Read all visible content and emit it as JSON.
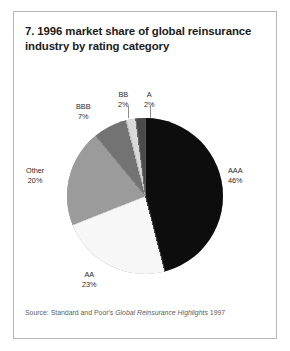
{
  "figure": {
    "title": "7. 1996 market share of global reinsurance industry by rating category",
    "source_prefix": "Source: Standard and Poor's ",
    "source_italic": "Global Reinsurance Highlights",
    "source_suffix": " 1997"
  },
  "chart_data": {
    "type": "pie",
    "title": "7. 1996 market share of global reinsurance industry by rating category",
    "unit": "percent",
    "categories": [
      "AAA",
      "AA",
      "Other",
      "BBB",
      "BB",
      "A"
    ],
    "values": [
      46,
      23,
      20,
      7,
      2,
      2
    ],
    "labels": [
      {
        "name": "AAA",
        "value": 46,
        "pct_text": "46%",
        "color": "#0d0d0d"
      },
      {
        "name": "AA",
        "value": 23,
        "pct_text": "23%",
        "color": "#f7f7f7"
      },
      {
        "name": "Other",
        "value": 20,
        "pct_text": "20%",
        "color": "#9b9b9b"
      },
      {
        "name": "BBB",
        "value": 7,
        "pct_text": "7%",
        "color": "#737373"
      },
      {
        "name": "BB",
        "value": 2,
        "pct_text": "2%",
        "color": "#d9d9d9"
      },
      {
        "name": "A",
        "value": 2,
        "pct_text": "2%",
        "color": "#4a4a4a"
      }
    ],
    "start_angle_deg": 0,
    "direction": "clockwise",
    "legend": "none",
    "grid": false
  },
  "colors": {
    "frame": "#b6b6b6",
    "background": "#ffffff",
    "title_text": "#1b1b1b",
    "label_text": "#2a2a2a",
    "source_text": "#5d5d5d"
  }
}
